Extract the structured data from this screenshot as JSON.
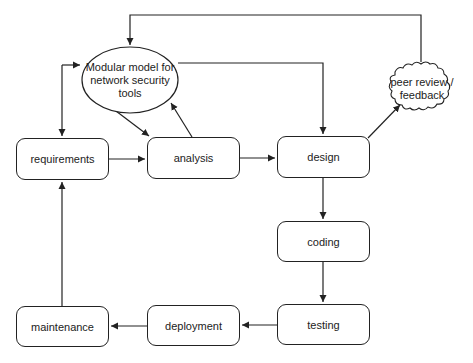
{
  "diagram": {
    "nodes": {
      "model": {
        "label": "Modular model for network security tools",
        "shape": "ellipse"
      },
      "requirements": {
        "label": "requirements",
        "shape": "rounded-rect"
      },
      "analysis": {
        "label": "analysis",
        "shape": "rounded-rect"
      },
      "design": {
        "label": "design",
        "shape": "rounded-rect"
      },
      "coding": {
        "label": "coding",
        "shape": "rounded-rect"
      },
      "testing": {
        "label": "testing",
        "shape": "rounded-rect"
      },
      "deployment": {
        "label": "deployment",
        "shape": "rounded-rect"
      },
      "maintenance": {
        "label": "maintenance",
        "shape": "rounded-rect"
      },
      "peer_review": {
        "label": "peer review / feedback",
        "shape": "cloud"
      }
    },
    "edges": [
      {
        "from": "requirements",
        "to": "analysis"
      },
      {
        "from": "analysis",
        "to": "design"
      },
      {
        "from": "design",
        "to": "coding"
      },
      {
        "from": "coding",
        "to": "testing"
      },
      {
        "from": "testing",
        "to": "deployment"
      },
      {
        "from": "deployment",
        "to": "maintenance"
      },
      {
        "from": "maintenance",
        "to": "requirements"
      },
      {
        "from": "model",
        "to": "requirements",
        "bidirectional": true
      },
      {
        "from": "model",
        "to": "analysis"
      },
      {
        "from": "analysis",
        "to": "model"
      },
      {
        "from": "model",
        "to": "design"
      },
      {
        "from": "design",
        "to": "peer_review"
      },
      {
        "from": "peer_review",
        "to": "model"
      }
    ],
    "colors": {
      "stroke": "#222222",
      "fill": "#ffffff",
      "text": "#222222"
    }
  }
}
